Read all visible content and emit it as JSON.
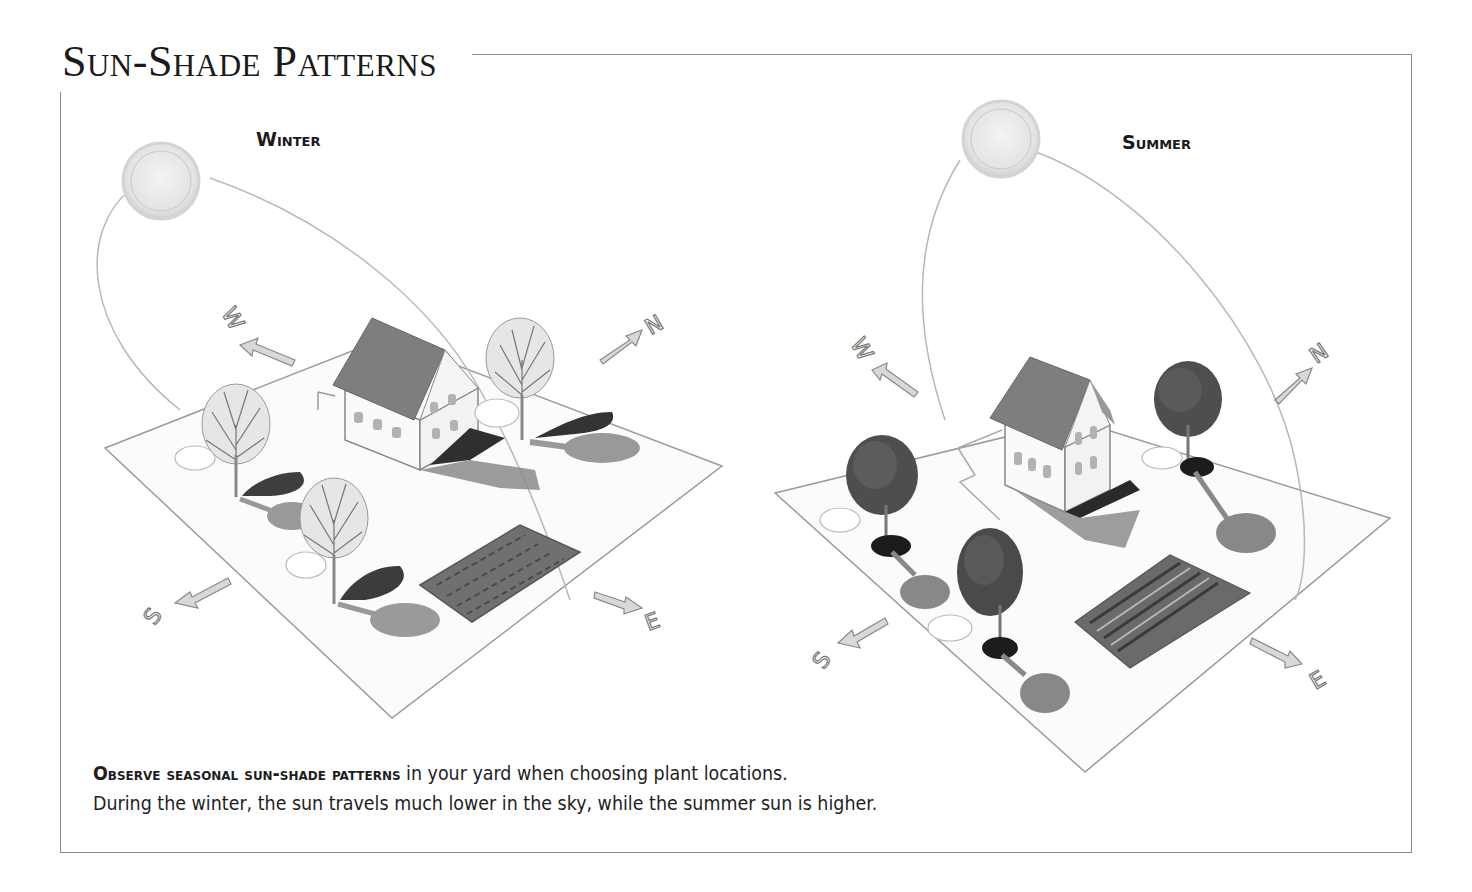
{
  "title": "Sun-Shade Patterns",
  "panels": [
    {
      "season": "Winter",
      "sun_position": "low",
      "compass": {
        "west": "W",
        "north": "N",
        "south": "S",
        "east": "E"
      },
      "elements": [
        "sun",
        "sun-path-arc",
        "house",
        "bare-trees",
        "tree-shadows",
        "garden-bed",
        "yard-plot"
      ]
    },
    {
      "season": "Summer",
      "sun_position": "high",
      "compass": {
        "west": "W",
        "north": "N",
        "south": "S",
        "east": "E"
      },
      "elements": [
        "sun",
        "sun-path-arc",
        "house",
        "leafy-trees",
        "tree-shadows",
        "garden-bed",
        "yard-plot"
      ]
    }
  ],
  "caption": {
    "lead": "Observe seasonal sun-shade patterns",
    "line1_rest": " in your yard when choosing plant locations.",
    "line2": "During the winter, the sun travels much lower in the sky, while the summer sun is higher."
  },
  "colors": {
    "frame": "#8a8a8a",
    "text": "#1a1a1a",
    "shadow_dark": "#3a3a3a",
    "shadow_mid": "#8c8c8c",
    "roof": "#777777",
    "sun": "#e6e6e6"
  }
}
